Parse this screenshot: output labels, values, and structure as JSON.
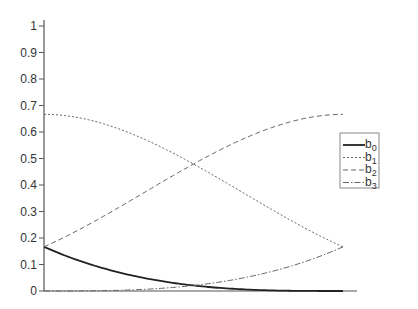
{
  "chart_data": {
    "type": "line",
    "title": "",
    "xlabel": "",
    "ylabel": "",
    "ylim": [
      0,
      1
    ],
    "xlim": [
      0,
      1
    ],
    "grid": false,
    "legend_position": "right",
    "yticks": [
      "0",
      "0.1",
      "0.2",
      "0.3",
      "0.4",
      "0.5",
      "0.6",
      "0.7",
      "0.8",
      "0.9",
      "1"
    ],
    "x": [
      0,
      0.1,
      0.2,
      0.3,
      0.4,
      0.5,
      0.6,
      0.7,
      0.8,
      0.9,
      1.0
    ],
    "series": [
      {
        "name": "b0",
        "style": "solid",
        "values": [
          0.1667,
          0.1215,
          0.0853,
          0.0572,
          0.036,
          0.0208,
          0.0107,
          0.0045,
          0.0013,
          0.0002,
          0.0
        ]
      },
      {
        "name": "b1",
        "style": "dotted",
        "values": [
          0.6667,
          0.6612,
          0.6453,
          0.6202,
          0.5867,
          0.5417,
          0.488,
          0.4282,
          0.3627,
          0.2922,
          0.1667
        ]
      },
      {
        "name": "b2",
        "style": "dashed",
        "values": [
          0.1667,
          0.2162,
          0.2653,
          0.3138,
          0.3613,
          0.4792,
          0.5187,
          0.5612,
          0.6013,
          0.6362,
          0.6667
        ]
      },
      {
        "name": "b3",
        "style": "dash-dot",
        "values": [
          0.0,
          0.0002,
          0.0013,
          0.0045,
          0.0107,
          0.0208,
          0.036,
          0.0572,
          0.0853,
          0.1215,
          0.1667
        ]
      }
    ]
  },
  "legend": {
    "items": [
      {
        "base": "b",
        "sub": "0"
      },
      {
        "base": "b",
        "sub": "1"
      },
      {
        "base": "b",
        "sub": "2"
      },
      {
        "base": "b",
        "sub": "3"
      }
    ]
  }
}
